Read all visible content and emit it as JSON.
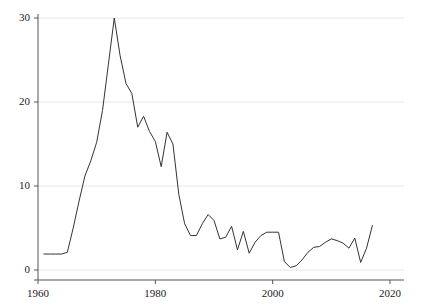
{
  "chart_data": {
    "type": "line",
    "title": "",
    "subtitle": "",
    "xlabel": "",
    "ylabel": "",
    "xlim": [
      1960,
      2020
    ],
    "ylim": [
      0,
      30
    ],
    "grid": true,
    "grid_axis": "y",
    "legend": false,
    "legend_position": "none",
    "line_color": "#333333",
    "grid_color": "#e6e6e6",
    "axis_color": "#555555",
    "xticks": [
      1960,
      1980,
      2000,
      2020
    ],
    "xtick_labels": [
      "1960",
      "1980",
      "2000",
      "2020"
    ],
    "yticks": [
      0,
      10,
      20,
      30
    ],
    "ytick_labels": [
      "0",
      "10",
      "20",
      "30"
    ],
    "series": [
      {
        "name": "series-1",
        "x": [
          1961,
          1962,
          1963,
          1964,
          1965,
          1966,
          1967,
          1968,
          1969,
          1970,
          1971,
          1972,
          1973,
          1974,
          1975,
          1976,
          1977,
          1978,
          1979,
          1980,
          1981,
          1982,
          1983,
          1984,
          1985,
          1986,
          1987,
          1988,
          1989,
          1990,
          1991,
          1992,
          1993,
          1994,
          1995,
          1996,
          1997,
          1998,
          1999,
          2000,
          2001,
          2002,
          2003,
          2004,
          2005,
          2006,
          2007,
          2008,
          2009,
          2010,
          2011,
          2012,
          2013,
          2014,
          2015,
          2016,
          2017
        ],
        "values": [
          1.9,
          1.9,
          1.9,
          1.9,
          2.1,
          5.0,
          8.2,
          11.2,
          13.0,
          15.2,
          19.0,
          24.5,
          30.0,
          25.5,
          22.2,
          21.0,
          17.0,
          18.3,
          16.5,
          15.3,
          12.3,
          16.4,
          15.0,
          9.0,
          5.5,
          4.1,
          4.1,
          5.5,
          6.6,
          5.9,
          3.7,
          3.9,
          5.2,
          2.4,
          4.6,
          2.0,
          3.3,
          4.1,
          4.5,
          4.5,
          4.5,
          1.0,
          0.3,
          0.5,
          1.2,
          2.1,
          2.7,
          2.8,
          3.3,
          3.7,
          3.5,
          3.2,
          2.6,
          3.8,
          0.9,
          2.6,
          5.3
        ]
      }
    ]
  }
}
